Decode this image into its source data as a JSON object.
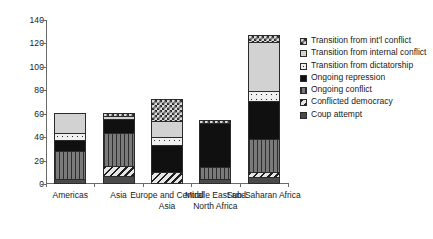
{
  "chart_data": {
    "type": "bar",
    "stacked": true,
    "title": "",
    "xlabel": "",
    "ylabel": "",
    "ylim": [
      0,
      140
    ],
    "ytick_values": [
      140,
      120,
      100,
      80,
      60,
      40,
      20,
      0
    ],
    "ytick_labels": [
      "140",
      "120",
      "100",
      "80",
      "60",
      "40",
      "20",
      "0"
    ],
    "grid": false,
    "legend_position": "right",
    "categories": [
      "Americas",
      "Asia",
      "Europe and Central Asia",
      "Middle East and North Africa",
      "Sub-Saharan Africa"
    ],
    "series": [
      {
        "name": "Coup attempt",
        "pattern": "solid-dark-gray",
        "values": [
          3,
          5,
          0,
          3,
          4
        ]
      },
      {
        "name": "Conflicted democracy",
        "pattern": "diagonal-hatch",
        "values": [
          0,
          9,
          9,
          0,
          5
        ]
      },
      {
        "name": "Ongoing conflict",
        "pattern": "vertical-lines",
        "values": [
          24,
          29,
          0,
          10,
          28
        ]
      },
      {
        "name": "Ongoing repression",
        "pattern": "solid-black",
        "values": [
          10,
          12,
          23,
          39,
          33
        ]
      },
      {
        "name": "Transition from dictatorship",
        "pattern": "dotted",
        "values": [
          6,
          0,
          7,
          0,
          9
        ]
      },
      {
        "name": "Transition from internal conflict",
        "pattern": "light-gray",
        "values": [
          18,
          3,
          14,
          0,
          42
        ]
      },
      {
        "name": "Transition from int'l conflict",
        "pattern": "checkerboard",
        "values": [
          0,
          3,
          20,
          3,
          6
        ]
      }
    ],
    "totals": [
      61,
      61,
      73,
      55,
      127
    ]
  },
  "legend": {
    "items": [
      {
        "label": "Transition from int'l conflict",
        "pattern": "checkerboard"
      },
      {
        "label": "Transition from internal conflict",
        "pattern": "light-gray"
      },
      {
        "label": "Transition from dictatorship",
        "pattern": "dotted"
      },
      {
        "label": "Ongoing repression",
        "pattern": "solid-black"
      },
      {
        "label": "Ongoing conflict",
        "pattern": "vertical-lines"
      },
      {
        "label": "Conflicted democracy",
        "pattern": "diagonal-hatch"
      },
      {
        "label": "Coup attempt",
        "pattern": "solid-dark-gray"
      }
    ]
  },
  "colors": {
    "axis": "#6b6b6b",
    "text": "#1a1a1a",
    "background": "#ffffff",
    "repression": "#101010",
    "conflict": "#7a7a7a",
    "internal": "#d2d2d2",
    "coup": "#4a4a4a"
  }
}
